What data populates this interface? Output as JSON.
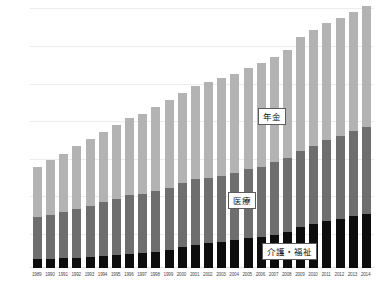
{
  "chart_data": {
    "type": "bar",
    "subtype": "stacked",
    "title": "",
    "xlabel": "",
    "ylabel": "",
    "grid": true,
    "legend_position": "inline-callout",
    "ylim": [
      0,
      120
    ],
    "categories": [
      "1989",
      "1990",
      "1991",
      "1992",
      "1993",
      "1994",
      "1995",
      "1996",
      "1997",
      "1998",
      "1999",
      "2000",
      "2001",
      "2002",
      "2003",
      "2004",
      "2005",
      "2006",
      "2007",
      "2008",
      "2009",
      "2010",
      "2011",
      "2012",
      "2013",
      "2014"
    ],
    "series": [
      {
        "name": "介護・福祉",
        "color": "#0d0d0d",
        "values": [
          4.0,
          4.2,
          4.4,
          4.7,
          5.0,
          5.4,
          5.8,
          6.2,
          6.6,
          7.2,
          8.0,
          9.5,
          10.5,
          11.2,
          12.0,
          12.8,
          13.6,
          14.3,
          15.2,
          16.4,
          18.6,
          20.0,
          21.2,
          22.4,
          23.6,
          24.6
        ]
      },
      {
        "name": "医療",
        "color": "#6e6e6e",
        "values": [
          19.0,
          20.0,
          21.0,
          22.2,
          23.4,
          24.6,
          25.8,
          26.8,
          27.0,
          27.6,
          28.4,
          29.0,
          29.8,
          29.6,
          30.0,
          30.6,
          31.4,
          31.8,
          32.8,
          33.6,
          34.6,
          35.6,
          36.8,
          37.6,
          38.6,
          39.6
        ]
      },
      {
        "name": "年金",
        "color": "#b3b3b3",
        "values": [
          23.0,
          24.8,
          26.6,
          28.4,
          30.2,
          32.0,
          33.6,
          35.0,
          36.6,
          38.2,
          40.0,
          41.2,
          42.4,
          43.6,
          44.4,
          45.0,
          46.0,
          47.0,
          48.0,
          49.2,
          51.6,
          52.6,
          53.2,
          53.8,
          54.4,
          55.0
        ]
      }
    ],
    "labels": {
      "pension": "年金",
      "medical": "医療",
      "care_welfare": "介護・福祉"
    }
  }
}
